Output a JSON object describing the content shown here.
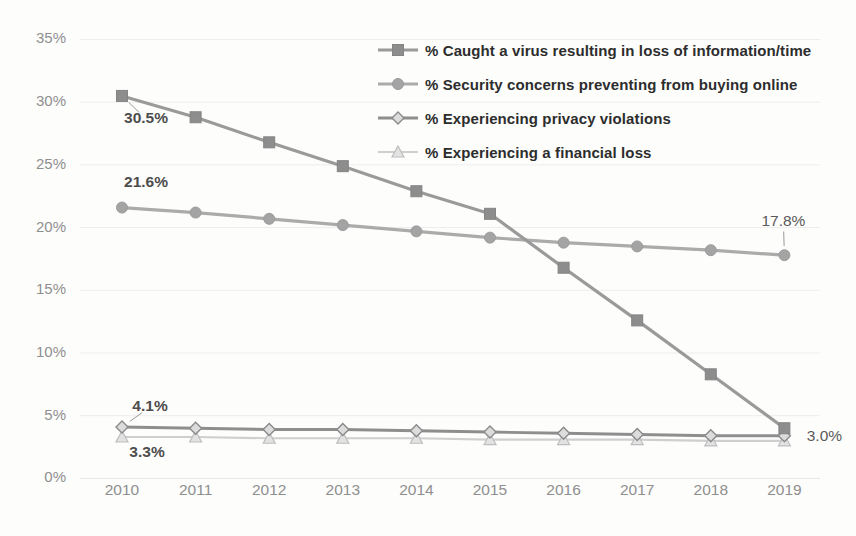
{
  "figure": {
    "background": "#fdfdfc",
    "axis_label_color": "#8f8f8f",
    "grid_color": "#ededed",
    "annotation_color_bold": "#4d4d4d",
    "annotation_color_plain": "#5a5a5a",
    "leader_color": "#9a9a9a"
  },
  "chart_data": {
    "type": "line",
    "categories": [
      "2010",
      "2011",
      "2012",
      "2013",
      "2014",
      "2015",
      "2016",
      "2017",
      "2018",
      "2019"
    ],
    "yticks": [
      "0%",
      "5%",
      "10%",
      "15%",
      "20%",
      "25%",
      "30%",
      "35%"
    ],
    "ylim": [
      0,
      35
    ],
    "ytick_step": 5,
    "grid": true,
    "legend_position": "top-right",
    "series": [
      {
        "name": "% Caught a virus resulting in loss of information/time",
        "marker": "square",
        "color": "#9a9a9a",
        "marker_fill": "#8d8d8d",
        "marker_stroke": "#848484",
        "line_width": 3.2,
        "marker_size": 11,
        "values": [
          30.5,
          28.8,
          26.8,
          24.9,
          22.9,
          21.1,
          16.8,
          12.6,
          8.3,
          4.0
        ]
      },
      {
        "name": "% Security concerns preventing from buying online",
        "marker": "circle",
        "color": "#ababab",
        "marker_fill": "#a4a4a4",
        "marker_stroke": "#9b9b9b",
        "line_width": 3.2,
        "marker_size": 11,
        "values": [
          21.6,
          21.2,
          20.7,
          20.2,
          19.7,
          19.2,
          18.8,
          18.5,
          18.2,
          17.8
        ]
      },
      {
        "name": "% Experiencing  privacy violations",
        "marker": "diamond",
        "color": "#8e8e8e",
        "marker_fill": "#dcdcdc",
        "marker_stroke": "#8a8a8a",
        "line_width": 2.8,
        "marker_size": 10,
        "values": [
          4.1,
          4.0,
          3.9,
          3.9,
          3.8,
          3.7,
          3.6,
          3.5,
          3.4,
          3.4
        ]
      },
      {
        "name": "% Experiencing a financial loss",
        "marker": "triangle",
        "color": "#cfcfcf",
        "marker_fill": "#e2e2e2",
        "marker_stroke": "#bdbdbd",
        "line_width": 2.2,
        "marker_size": 10,
        "values": [
          3.3,
          3.3,
          3.2,
          3.2,
          3.2,
          3.1,
          3.1,
          3.1,
          3.0,
          3.0
        ]
      }
    ],
    "annotations": [
      {
        "text": "30.5%",
        "series": 0,
        "index": 0,
        "dx": 24,
        "dy": 23,
        "bold": true,
        "leader": true
      },
      {
        "text": "21.6%",
        "series": 1,
        "index": 0,
        "dx": 24,
        "dy": -25,
        "bold": true,
        "leader": false
      },
      {
        "text": "17.8%",
        "series": 1,
        "index": 9,
        "dx": -1,
        "dy": -33,
        "bold": false,
        "leader": true
      },
      {
        "text": "4.1%",
        "series": 2,
        "index": 0,
        "dx": 28,
        "dy": -20,
        "bold": true,
        "leader": true
      },
      {
        "text": "3.3%",
        "series": 3,
        "index": 0,
        "dx": 25,
        "dy": 16,
        "bold": true,
        "leader": false
      },
      {
        "text": "3.0%",
        "series": 3,
        "index": 9,
        "dx": 40,
        "dy": -4,
        "bold": false,
        "leader": false
      }
    ]
  }
}
